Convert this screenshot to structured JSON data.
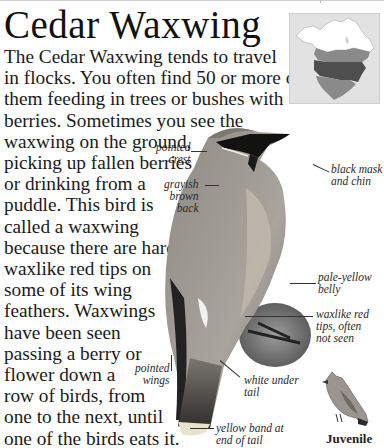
{
  "page": {
    "title": "Cedar Waxwing",
    "body_lines": [
      "The Cedar Waxwing tends to travel",
      "in flocks. You often find 50 or more of",
      "them feeding in trees or bushes with",
      "berries. Sometimes you see the",
      "waxwing on the ground,",
      "picking up fallen berries",
      "or drinking from a",
      "puddle. This bird is",
      "called a waxwing",
      "because there are hard,",
      "waxlike red tips on",
      "some of its wing",
      "feathers. Waxwings",
      "have been seen",
      "passing a berry or",
      "flower down a",
      "row of birds, from",
      "one to the next, until",
      "one of the birds eats it."
    ]
  },
  "map": {
    "description": "range-map-north-america",
    "colors": {
      "background": "#e2e2e2",
      "summer": "#ffffff",
      "year_round": "#555555",
      "winter": "#8a8a8a"
    }
  },
  "labels": {
    "pointed_crest": [
      "pointed",
      "crest"
    ],
    "black_mask": [
      "black mask",
      "and chin"
    ],
    "grayish_back": [
      "grayish",
      "brown",
      "back"
    ],
    "pale_belly": [
      "pale-yellow",
      "belly"
    ],
    "waxlike_tips": [
      "waxlike red",
      "tips, often",
      "not seen"
    ],
    "pointed_wings": [
      "pointed",
      "wings"
    ],
    "white_tail": [
      "white under",
      "tail"
    ],
    "yellow_band": [
      "yellow band at",
      "end of tail"
    ]
  },
  "juvenile": {
    "label": "Juvenile"
  }
}
